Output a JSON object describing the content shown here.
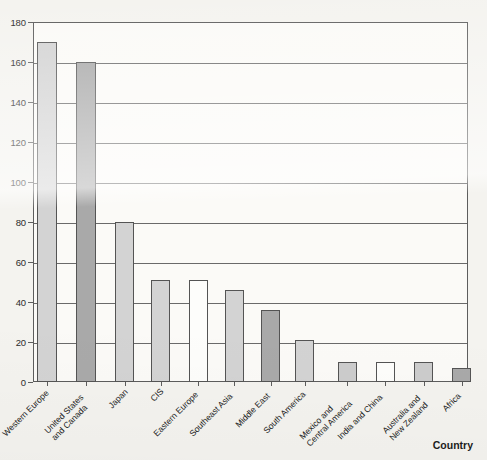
{
  "chart_data": {
    "type": "bar",
    "title": "",
    "subtitle": "",
    "xlabel": "Country",
    "ylabel": "",
    "ylim": [
      0,
      180
    ],
    "ytick_step": 20,
    "yticks": [
      0,
      20,
      40,
      60,
      80,
      100,
      120,
      140,
      160,
      180
    ],
    "ytick_labels": [
      "0",
      "20",
      "40",
      "60",
      "80",
      "100",
      "120",
      "140",
      "160",
      "180"
    ],
    "grid": true,
    "grid_axis": "y",
    "legend": false,
    "legend_position": "none",
    "categories": [
      "Western Europe",
      "United States and Canada",
      "Japan",
      "CIS",
      "Eastern Europe",
      "Southeast Asia",
      "Middle East",
      "South America",
      "Mexico and Central America",
      "India and China",
      "Australia and New Zealand",
      "Africa"
    ],
    "category_label_lines": [
      [
        "Western Europe"
      ],
      [
        "United States",
        "and Canada"
      ],
      [
        "Japan"
      ],
      [
        "CIS"
      ],
      [
        "Eastern Europe"
      ],
      [
        "Southeast Asia"
      ],
      [
        "Middle East"
      ],
      [
        "South America"
      ],
      [
        "Mexico and",
        "Central America"
      ],
      [
        "India and China"
      ],
      [
        "Australia and",
        "New Zealand"
      ],
      [
        "Africa"
      ]
    ],
    "values": [
      170,
      160,
      80,
      51,
      51,
      46,
      36,
      21,
      10,
      10,
      10,
      7
    ],
    "bar_fills": [
      "#d3d3d3",
      "#a9a9a9",
      "#d3d3d3",
      "#d3d3d3",
      "#fdfdfb",
      "#d3d3d3",
      "#a9a9a9",
      "#d3d3d3",
      "#cccccc",
      "#fdfdfb",
      "#cccccc",
      "#a9a9a9"
    ],
    "bar_edge_color": "#545454",
    "axis_color": "#5d5d5d",
    "grid_color": "#6a6a6a",
    "plot_background": "#fbfaf7",
    "page_background": "#f4f3ef"
  }
}
